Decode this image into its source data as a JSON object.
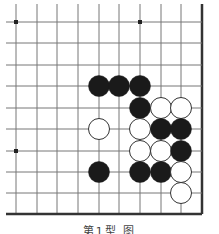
{
  "board": {
    "grid": {
      "cols_x": [
        16,
        37,
        57,
        78,
        99,
        119,
        140,
        161,
        181,
        202
      ],
      "rows_y": [
        22,
        43,
        65,
        86,
        108,
        129,
        151,
        172,
        193,
        214
      ],
      "line_left": 6,
      "line_top": 4,
      "right_edge_x": 202,
      "bottom_edge_y": 214,
      "line_color": "#777777",
      "edge_color": "#333333"
    },
    "star_points": [
      {
        "col": 0,
        "row": 0
      },
      {
        "col": 6,
        "row": 0
      },
      {
        "col": 0,
        "row": 6
      }
    ],
    "stone_radius": 10.5,
    "stones": [
      {
        "color": "black",
        "col": 4,
        "row": 3
      },
      {
        "color": "black",
        "col": 5,
        "row": 3
      },
      {
        "color": "black",
        "col": 6,
        "row": 3
      },
      {
        "color": "black",
        "col": 6,
        "row": 4
      },
      {
        "color": "white",
        "col": 7,
        "row": 4
      },
      {
        "color": "white",
        "col": 8,
        "row": 4
      },
      {
        "color": "white",
        "col": 4,
        "row": 5
      },
      {
        "color": "white",
        "col": 6,
        "row": 5
      },
      {
        "color": "black",
        "col": 7,
        "row": 5
      },
      {
        "color": "black",
        "col": 8,
        "row": 5
      },
      {
        "color": "white",
        "col": 6,
        "row": 6
      },
      {
        "color": "white",
        "col": 7,
        "row": 6
      },
      {
        "color": "black",
        "col": 8,
        "row": 6
      },
      {
        "color": "black",
        "col": 4,
        "row": 7
      },
      {
        "color": "black",
        "col": 6,
        "row": 7
      },
      {
        "color": "black",
        "col": 7,
        "row": 7
      },
      {
        "color": "white",
        "col": 8,
        "row": 7
      },
      {
        "color": "white",
        "col": 8,
        "row": 8
      }
    ],
    "colors": {
      "black_stone": "#1a1a1a",
      "white_stone": "#ffffff",
      "white_outline": "#333333"
    }
  },
  "caption": "第1型 图"
}
